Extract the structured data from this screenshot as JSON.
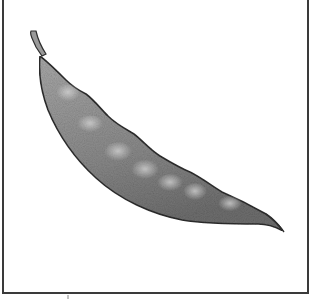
{
  "image": {
    "subject": "pea pod illustration",
    "style": "stippled pencil drawing",
    "alt": "Pencil drawing of a curved pea pod with visible pea bumps, inside a thin black frame"
  },
  "colors": {
    "frame": "#3a3a3a",
    "pod_fill": "#8f8f8f",
    "pod_outline": "#2e2e2e",
    "highlight": "#c9c9c9",
    "background": "#ffffff"
  }
}
